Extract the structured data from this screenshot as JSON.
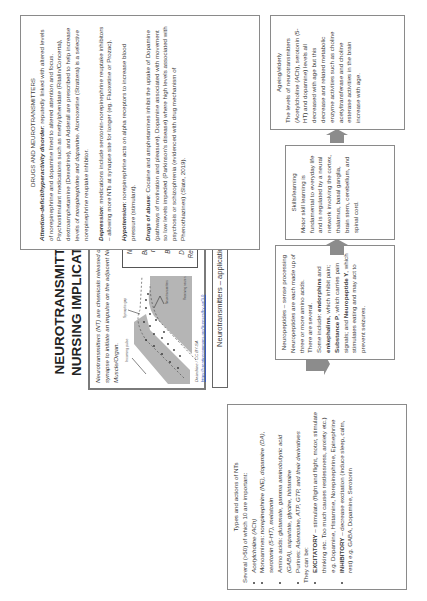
{
  "poster": {
    "title_line1": "NEUROTRANSMITTERS:",
    "title_line2": "NURSING IMPLICATIONS",
    "intro": "Neurotransmitters (NT) are chemicals released during a synapse to initiate an impulse on the adjacent Neuron or Muscle/Organ.",
    "diagram": {
      "label_incoming_pulse": "Incoming pulse",
      "label_synaptic_gap": "Synaptic gap",
      "label_receptor": "Receiving neuron",
      "label_neurotransmitters": "Neurotransmitters",
      "credit": "Dwindrine / CC BY-SA",
      "credit_link": "https://creativecommons.org/licenses/by-sa/3.0",
      "flow_steps": [
        "NT released",
        "Bind/activate membrane",
        "Break loose",
        "Degrade OR Reabsorbed by neuron"
      ],
      "flow_arrows": [
        "↓",
        "↓",
        "↓"
      ]
    },
    "application_label": "Neurotransmitters – application"
  },
  "types_panel": {
    "heading": "Types and actions of NTs",
    "intro": "Several (>50) of which 10 are important:",
    "items": [
      {
        "prefix": "",
        "text": "Acetylcholine (ACh)"
      },
      {
        "prefix": "Monoamines: ",
        "text": "norepinephrine (NE), dopamine (DA), serotonin (5-HT), melatonin"
      },
      {
        "prefix": "Amino acids: ",
        "text": "glutamate, gamma aminobutyric acid (GABA), aspartate, glycine, histamine"
      },
      {
        "prefix": "Purines: ",
        "text": "Adenosine, ATP, GTP, and their derivatives"
      }
    ],
    "they_can_be": "They can be:",
    "kinds": [
      {
        "label": "EXCITATORY",
        "text": " – stimulate (flight and flight, motor, stimulate thinking etc. Too much causes restlessness, anxiety etc.) e.g. Dopamine, Histamine, Norepinephrine, Epinephrine"
      },
      {
        "label": "INHIBITORY",
        "text": " – decrease excitation (induce sleep, calm, rest) e.g. GABA, Dopamine, Serotonin"
      }
    ]
  },
  "acetylcholine_panel": {
    "heading": "Acetylcholine",
    "intro": "First neurotransmitter discovered – found in the brain, spinal cord and particularly at the neuromuscular junction of the skeletal muscle.",
    "bullets": [
      "Can act excitatory or inhibitory.",
      "Synthesized from dietary choline (red meat and vegetables)."
    ],
    "alzheimers": "Alzheimer's disease linked with decreased ACh in neurons.",
    "physiologic_heading": "Physiologic effects and functions:",
    "physiologic": [
      "Muscular stimulation – acetylcholine signals muscles to become active.",
      "Controls the sleep and wakefulness cycle – scheduling the rapid eye movement (REM) sleep or dream."
    ]
  },
  "neuropeptides_panel": {
    "heading": "Neuropeptides – sense processing",
    "text1": "Neuropeptides are each made up of three or more amino acids.",
    "text2": "There are several.",
    "text3_pre": "Some include: ",
    "endorphins": "endorphins",
    "and1": " and ",
    "enkephalins": "enkephalins",
    "text4": ", which inhibit pain; ",
    "substance_p": "Substance P",
    "text5": ", which carries pain signals; and ",
    "neuropeptide_y": "Neuropeptide Y",
    "text6": ", which stimulates eating and may act to prevent seizures."
  },
  "skills_panel": {
    "heading": "Skills/learning",
    "text": "Motor skill learning is fundamental to everyday life and is regulated by a neural network involving the cortex, thalamus, basal ganglia, brain stem, cerebellum, and spinal cord."
  },
  "ageing_panel": {
    "heading": "Ageing/elderly",
    "text": "The levels of neurotransmitters (Acetylcholine (ACh), serotonin (5-HT) and dopamine) levels all decreased with age but this decrease and related metabolic enzyme activities such as choline acetyltransferase and choline esterase activities in the brain increase with age."
  },
  "drugs_panel": {
    "heading": "DRUGS AND NEUROTRANSMITTERS",
    "adhd_label": "Attention-deficit/hyperactivity disorder",
    "adhd_text1": ": reputedly linked with altered levels of norepinephrine and dopamine lined to altered attention and focus. Psychostimulant medications such as methylphenidate (Ritalin/Concerta), dextroamphetamine (Dexedrine), and Adderall are prescribed to help increase levels of ",
    "adhd_italic": "norepinephrine and dopamine",
    "adhd_text2": ". Atomoxetine (Strattera) is a selective norepinephrine reuptake inhibitor.",
    "depression_label": "Depression",
    "depression_text": ": medications include serotonin-norepinephrine reuptake inhibitors – allowing more NTs at synapse site for longer (eg. Fluoxetine or Prozac).",
    "hypotension_label": "Hypotension",
    "hypotension_text": ": norepinephrine acts on alpha receptors to increase blood pressure (stimulant).",
    "abuse_label": "Drugs of abuse",
    "abuse_text": ": Cocaine and amphetamines inhibit the uptake of Dopamine (pathways of motivation and pleasure). Dopamine associated with movement so low levels impeded (Parkinson's disease) where high levels associated with psychosis or schizophrenia (evidenced with drug mechanism of Phenothiazines) (Slate, 2019)."
  },
  "colors": {
    "border": "#8a8a8a",
    "arrow": "#8c8c8c",
    "diagram_gray": "#b5b5b5",
    "text": "#3a3a3a"
  }
}
